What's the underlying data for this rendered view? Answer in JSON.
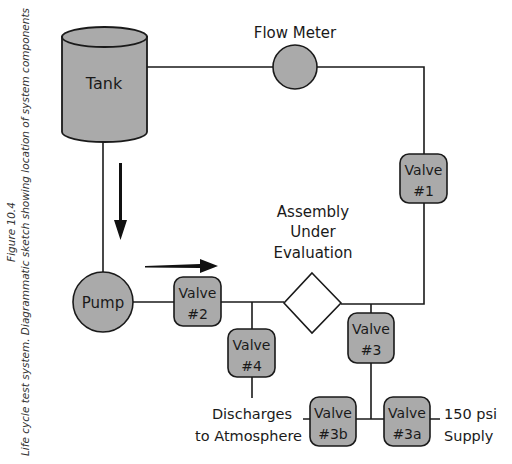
{
  "caption": {
    "figure_number": "Figure 10.4",
    "text": "Life cycle test system.   Diagrammatic sketch showing location of system components"
  },
  "components": {
    "tank": "Tank",
    "flow_meter": "Flow Meter",
    "pump": "Pump",
    "assembly": [
      "Assembly",
      "Under",
      "Evaluation"
    ],
    "valve1": [
      "Valve",
      "#1"
    ],
    "valve2": [
      "Valve",
      "#2"
    ],
    "valve3": [
      "Valve",
      "#3"
    ],
    "valve4": [
      "Valve",
      "#4"
    ],
    "valve3a": [
      "Valve",
      "#3a"
    ],
    "valve3b": [
      "Valve",
      "#3b"
    ],
    "discharge": [
      "Discharges",
      "to Atmosphere"
    ],
    "supply": [
      "150 psi",
      "Supply"
    ]
  },
  "colors": {
    "fill": "#aaaaaa",
    "stroke": "#1a1a1a",
    "background": "#ffffff"
  }
}
